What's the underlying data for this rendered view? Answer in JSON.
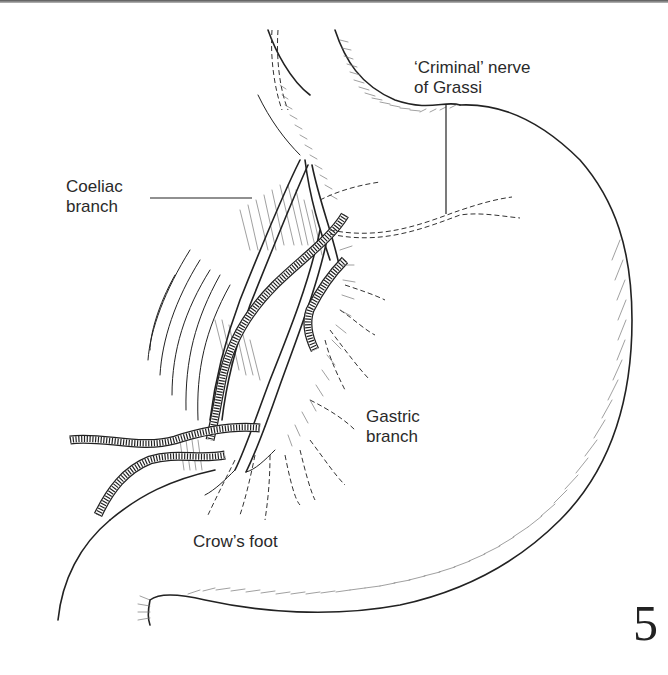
{
  "figure": {
    "number": "5"
  },
  "labels": {
    "criminal_nerve_line1": "‘Criminal’ nerve",
    "criminal_nerve_line2": "of Grassi",
    "coeliac_line1": "Coeliac",
    "coeliac_line2": "branch",
    "gastric_line1": "Gastric",
    "gastric_line2": "branch",
    "crows_foot": "Crow’s foot"
  },
  "colors": {
    "ink": "#222222",
    "background": "#ffffff"
  }
}
